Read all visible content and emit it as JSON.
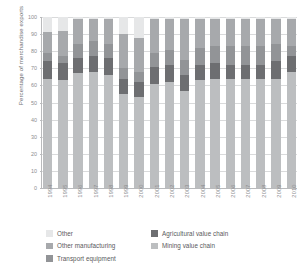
{
  "chart_data": {
    "type": "bar",
    "stacked": true,
    "title": "",
    "xlabel": "",
    "ylabel": "Percentage of merchandise exports",
    "ylim": [
      0,
      100
    ],
    "ytick_labels": [
      "100",
      "90",
      "80",
      "70",
      "60",
      "50",
      "40",
      "30",
      "20",
      "10",
      "0"
    ],
    "ytick_values": [
      100,
      90,
      80,
      70,
      60,
      50,
      40,
      30,
      20,
      10,
      0
    ],
    "grid": true,
    "legend_position": "bottom",
    "categories": [
      "1994",
      "1995",
      "1996",
      "1997",
      "1998",
      "1999",
      "2000",
      "2001",
      "2002",
      "2003",
      "2004",
      "2005",
      "2006",
      "2007",
      "2008",
      "2009",
      "2010"
    ],
    "series": [
      {
        "name": "Mining value chain",
        "color": "#bcbec0",
        "values": [
          64,
          63,
          67,
          68,
          66,
          55,
          53,
          61,
          62,
          57,
          63,
          64,
          64,
          64,
          64,
          64,
          68
        ]
      },
      {
        "name": "Agricultural value chain",
        "color": "#6d6e71",
        "values": [
          10,
          10,
          9,
          9,
          10,
          9,
          9,
          10,
          10,
          9,
          9,
          9,
          8,
          8,
          8,
          10,
          9
        ]
      },
      {
        "name": "Transport equipment",
        "color": "#929497",
        "values": [
          5,
          4,
          8,
          9,
          8,
          6,
          6,
          8,
          9,
          9,
          10,
          10,
          11,
          11,
          11,
          10,
          6
        ]
      },
      {
        "name": "Other manufacturing",
        "color": "#a7a9ac",
        "values": [
          12,
          15,
          15,
          13,
          15,
          20,
          20,
          20,
          18,
          24,
          17,
          16,
          16,
          16,
          16,
          15,
          16
        ]
      },
      {
        "name": "Other",
        "color": "#e6e7e8",
        "values": [
          9,
          8,
          1,
          1,
          1,
          10,
          12,
          1,
          1,
          1,
          1,
          1,
          1,
          1,
          1,
          1,
          1
        ]
      }
    ],
    "legend_entries": [
      {
        "label": "Other",
        "color": "#e6e7e8"
      },
      {
        "label": "Other manufacturing",
        "color": "#a7a9ac"
      },
      {
        "label": "Transport equipment",
        "color": "#929497"
      },
      {
        "label": "Agricultural value chain",
        "color": "#6d6e71"
      },
      {
        "label": "Mining value chain",
        "color": "#bcbec0"
      }
    ]
  },
  "legend": {
    "left_column": [
      {
        "label": "Other",
        "color": "#e6e7e8"
      },
      {
        "label": "Other manufacturing",
        "color": "#a7a9ac"
      },
      {
        "label": "Transport equipment",
        "color": "#929497"
      }
    ],
    "right_column": [
      {
        "label": "Agricultural value chain",
        "color": "#6d6e71"
      },
      {
        "label": "Mining value chain",
        "color": "#bcbec0"
      }
    ]
  },
  "axis": {
    "y_title": "Percentage of merchandise exports"
  },
  "colors": {
    "grid": "#d9dadb",
    "axis": "#b9babc",
    "tick_text": "#8c8d8f",
    "legend_text": "#58595b"
  }
}
